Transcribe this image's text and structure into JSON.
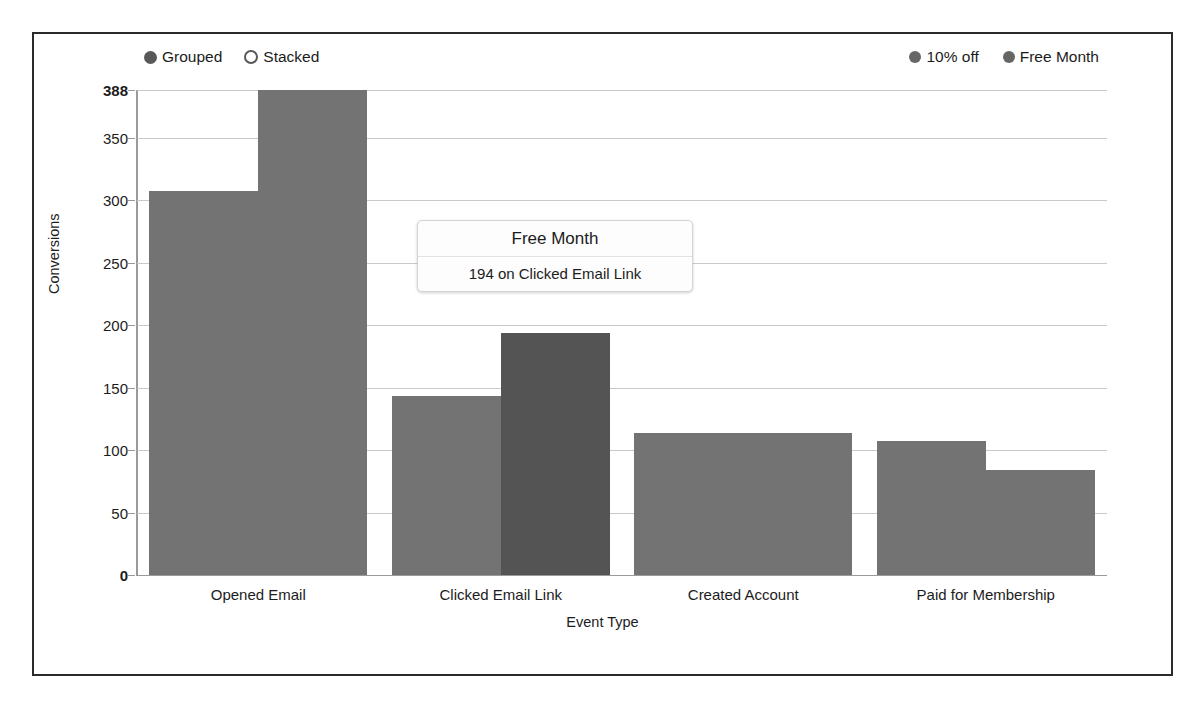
{
  "controls": {
    "layout_options": [
      {
        "label": "Grouped",
        "selected": true
      },
      {
        "label": "Stacked",
        "selected": false
      }
    ]
  },
  "legend": {
    "position": "top-right",
    "entries": [
      {
        "label": "10% off",
        "color": "#737373"
      },
      {
        "label": "Free Month",
        "color": "#737373"
      }
    ]
  },
  "tooltip": {
    "title": "Free Month",
    "body": "194 on Clicked Email Link",
    "value": 194,
    "series": "Free Month",
    "category": "Clicked Email Link"
  },
  "colors": {
    "bar": "#737373",
    "bar_highlight": "#545454",
    "grid": "#c9c9c9",
    "axis": "#9a9a9a",
    "frame": "#2b2b2b",
    "text": "#1c1c1c",
    "background": "#ffffff"
  },
  "chart_data": {
    "type": "bar",
    "title": "",
    "xlabel": "Event Type",
    "ylabel": "Conversions",
    "grouping": "grouped",
    "grid": true,
    "legend_position": "top-right",
    "categories": [
      "Opened Email",
      "Clicked Email Link",
      "Created Account",
      "Paid for Membership"
    ],
    "series": [
      {
        "name": "10% off",
        "values": [
          307,
          143,
          114,
          107
        ]
      },
      {
        "name": "Free Month",
        "values": [
          388,
          194,
          114,
          84
        ]
      }
    ],
    "highlighted_point": {
      "series": "Free Month",
      "category": "Clicked Email Link",
      "value": 194
    },
    "ylim": [
      0,
      388
    ],
    "yticks": [
      0,
      50,
      100,
      150,
      200,
      250,
      300,
      350,
      388
    ],
    "ytick_labels": [
      "0",
      "50",
      "100",
      "150",
      "200",
      "250",
      "300",
      "350",
      "388"
    ]
  }
}
